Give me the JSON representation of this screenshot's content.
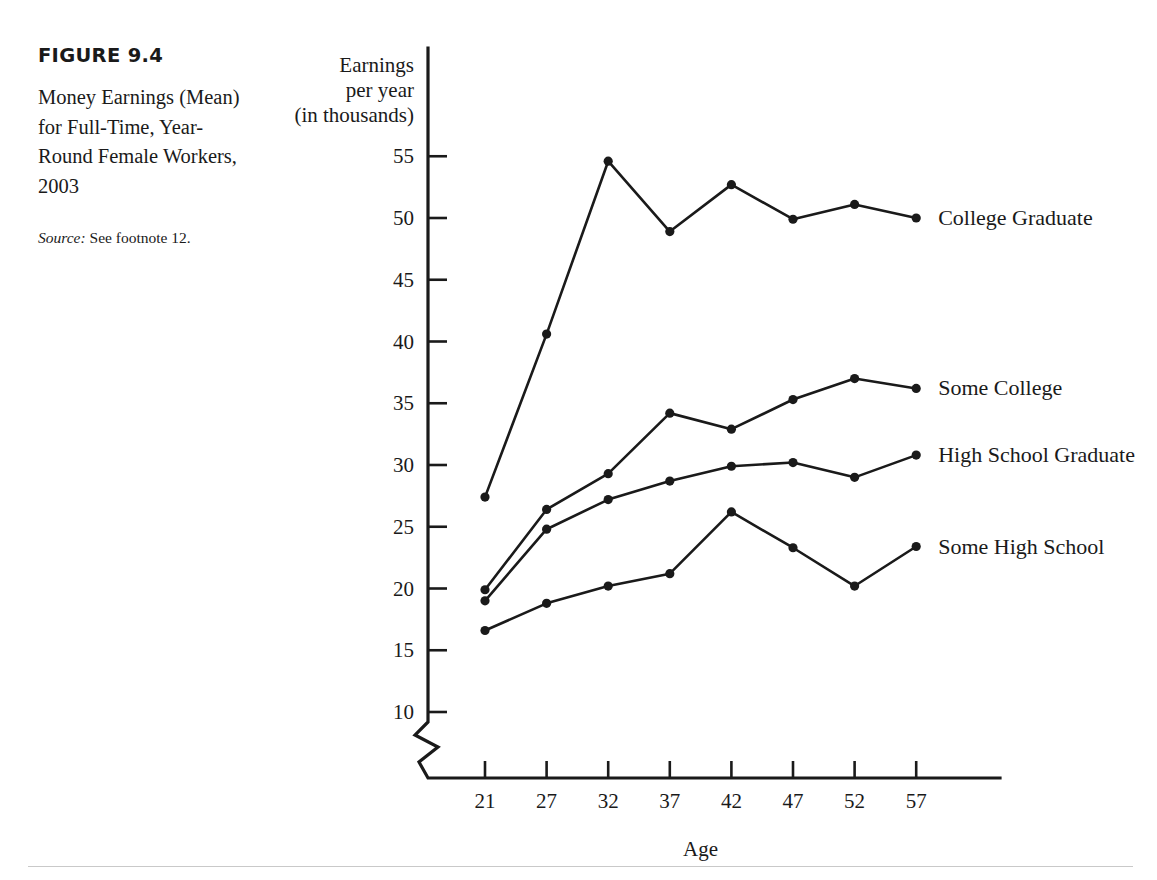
{
  "figure": {
    "number": "FIGURE 9.4",
    "title": "Money Earnings (Mean) for Full-Time, Year-Round Female Workers, 2003",
    "source_label": "Source:",
    "source_text": " See footnote 12."
  },
  "chart_data": {
    "type": "line",
    "title": "Money Earnings (Mean) for Full-Time, Year-Round Female Workers, 2003",
    "xlabel": "Age",
    "ylabel": "Earnings per year (in thousands)",
    "ylabel_lines": [
      "Earnings",
      "per year",
      "(in thousands)"
    ],
    "x": [
      21,
      27,
      32,
      37,
      42,
      47,
      52,
      57
    ],
    "xtick_labels": [
      "21",
      "27",
      "32",
      "37",
      "42",
      "47",
      "52",
      "57"
    ],
    "ytick_labels": [
      "10",
      "15",
      "20",
      "25",
      "30",
      "35",
      "40",
      "45",
      "50",
      "55"
    ],
    "yticks": [
      10,
      15,
      20,
      25,
      30,
      35,
      40,
      45,
      50,
      55
    ],
    "ylim": [
      8.5,
      57
    ],
    "xlim": [
      19,
      60
    ],
    "grid": false,
    "legend_position": "right-inline",
    "axis_break": true,
    "series": [
      {
        "name": "College Graduate",
        "values": [
          27.4,
          40.6,
          54.6,
          48.9,
          52.7,
          49.9,
          51.1,
          50.0
        ],
        "label_x": 57,
        "label_y": 50.0
      },
      {
        "name": "Some College",
        "values": [
          19.9,
          26.4,
          29.3,
          34.2,
          32.9,
          35.3,
          37.0,
          36.2
        ],
        "label_x": 57,
        "label_y": 36.2
      },
      {
        "name": "High School Graduate",
        "values": [
          19.0,
          24.8,
          27.2,
          28.7,
          29.9,
          30.2,
          29.0,
          30.8
        ],
        "label_x": 57,
        "label_y": 30.8
      },
      {
        "name": "Some High School",
        "values": [
          16.6,
          18.8,
          20.2,
          21.2,
          26.2,
          23.3,
          20.2,
          23.4
        ],
        "label_x": 57,
        "label_y": 23.4
      }
    ]
  },
  "colors": {
    "ink": "#1a1a1a",
    "rule": "#c9c9c9",
    "background": "#ffffff"
  }
}
